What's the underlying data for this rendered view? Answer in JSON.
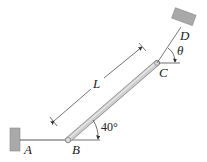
{
  "diagram": {
    "type": "mechanics-figure",
    "labels": {
      "A": "A",
      "B": "B",
      "C": "C",
      "D": "D",
      "L": "L",
      "theta": "θ",
      "angle_B": "40°"
    },
    "values": {
      "rod_angle_deg": 40
    },
    "colors": {
      "wall": "#a9a9a9",
      "wall_edge": "#8a8a8a",
      "rod_fill": "#c9c9c9",
      "rod_edge": "#8f8f8f",
      "line": "#333333",
      "text": "#222222"
    }
  }
}
